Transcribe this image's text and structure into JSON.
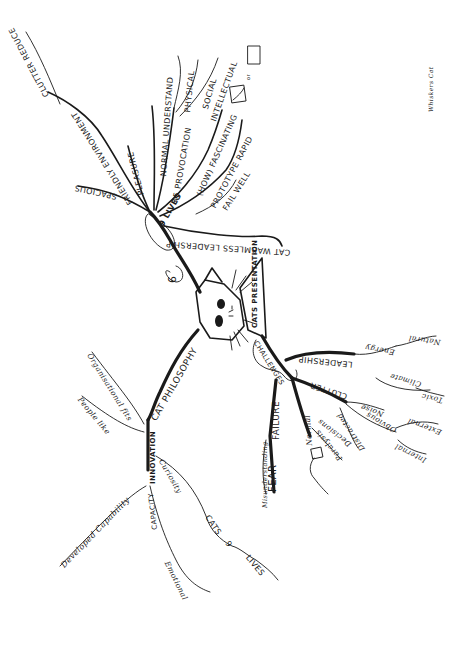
{
  "signature": "Whiskers Cat",
  "center": {
    "label": "CAT",
    "icon": "cat-face-icon"
  },
  "branches": {
    "lives": {
      "label": "9 LIVES",
      "number": "9",
      "children": [
        {
          "num": "1",
          "label": "SPACIOUS"
        },
        {
          "num": "1",
          "label": "FRIENDLY ENVIRONMENT"
        },
        {
          "num": "",
          "label": "CLUTTER REDUCE"
        },
        {
          "num": "2",
          "label": "PLEASURE"
        },
        {
          "num": "3",
          "label": "NORMAL UNDERSTAND"
        },
        {
          "num": "4",
          "label": "45 PROVOCATION"
        },
        {
          "num": "",
          "label": "PHYSICAL"
        },
        {
          "num": "",
          "label": "SOCIAL"
        },
        {
          "num": "",
          "label": "INTELLECTUAL"
        },
        {
          "num": "7",
          "label": "(HOW) FASCINATING"
        },
        {
          "num": "8",
          "label": "PROTOTYPE RAPID"
        },
        {
          "num": "",
          "label": "FAIL WELL"
        },
        {
          "num": "6",
          "label": "CAT WARMLESS LEADERSHIP"
        }
      ],
      "sketch_or": "or"
    },
    "presentation": {
      "label": "CATS PRESENTATION"
    },
    "challenges": {
      "label": "CHALLENGES",
      "children": [
        {
          "label": "LEADERSHIP",
          "sub": [
            "Energy",
            "Natural"
          ]
        },
        {
          "label": "Climate",
          "sub": [
            "Toxic"
          ]
        },
        {
          "label": "CLUTTER",
          "sub": [
            "Noise",
            "Obvious",
            "Internal",
            "External",
            "Distracted"
          ]
        },
        {
          "label": "Normal",
          "sub": [
            "Paralysis",
            "Decisions"
          ]
        },
        {
          "label": "FAILURE",
          "sub": [
            "FEAR",
            "Misunderstanding"
          ]
        }
      ]
    },
    "philosophy": {
      "label": "CAT PHILOSOPHY",
      "children": [
        {
          "label": "INNOVATION",
          "sub": [
            "Organisational fits",
            "People like"
          ]
        },
        {
          "label": "CAPACITY",
          "sub": [
            "Developed Capability",
            "Emotional"
          ]
        },
        {
          "label": "Curiosity",
          "sub": [
            "CATS",
            "9",
            "LIVES"
          ]
        }
      ]
    }
  }
}
